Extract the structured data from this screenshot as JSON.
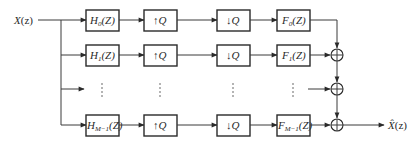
{
  "diagram": {
    "type": "filter-bank",
    "input": {
      "label": "X",
      "arg": "(z)"
    },
    "output": {
      "label": "X̂",
      "arg": "(z)"
    },
    "rows": [
      {
        "analysis": {
          "base": "H",
          "sub": "0",
          "arg": "(Z)"
        },
        "up": "↑Q",
        "down": "↓Q",
        "synthesis": {
          "base": "F",
          "sub": "0",
          "arg": "(Z)"
        }
      },
      {
        "analysis": {
          "base": "H",
          "sub": "1",
          "arg": "(Z)"
        },
        "up": "↑Q",
        "down": "↓Q",
        "synthesis": {
          "base": "F",
          "sub": "1",
          "arg": "(Z)"
        }
      },
      {
        "ellipsis": "⋮"
      },
      {
        "analysis": {
          "base": "H",
          "sub": "M−1",
          "arg": "(Z)"
        },
        "up": "↑Q",
        "down": "↓Q",
        "synthesis": {
          "base": "F",
          "sub": "M−1",
          "arg": "(Z)"
        }
      }
    ],
    "adder_symbol": "⊕",
    "colors": {
      "stroke": "#2a2a2a",
      "background": "#ffffff"
    }
  }
}
